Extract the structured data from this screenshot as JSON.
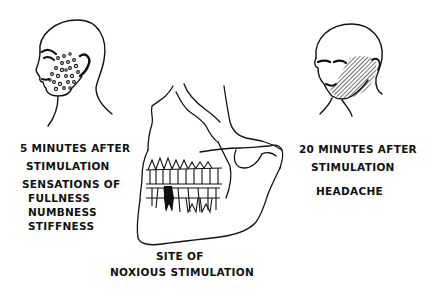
{
  "diagram": {
    "left_panel": {
      "time_label_line1": "5 MINUTES AFTER",
      "time_label_line2": "STIMULATION",
      "sensation_heading": "SENSATIONS OF",
      "sensations": [
        "FULLNESS",
        "NUMBNESS",
        "STIFFNESS"
      ],
      "illustration": "head-profile-with-dotted-cheek"
    },
    "right_panel": {
      "time_label_line1": "20 MINUTES AFTER",
      "time_label_line2": "STIMULATION",
      "sensation": "HEADACHE",
      "illustration": "head-with-hatched-cheek"
    },
    "center_panel": {
      "caption_line1": "SITE OF",
      "caption_line2": "NOXIOUS STIMULATION",
      "illustration": "skull-jaw-with-darkened-tooth"
    },
    "colors": {
      "ink": "#111111",
      "background": "#ffffff"
    }
  }
}
